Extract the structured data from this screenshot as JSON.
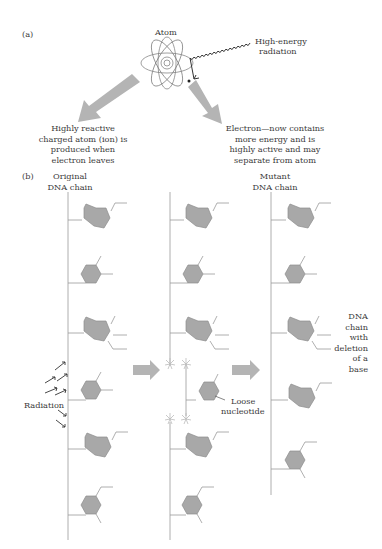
{
  "panel_a": {
    "label": "(a)",
    "atom_label": "Atom",
    "radiation_label_line1": "High-energy",
    "radiation_label_line2": "radiation",
    "left_result": [
      "Highly reactive",
      "charged atom (ion) is",
      "produced when",
      "electron leaves"
    ],
    "right_result": [
      "Electron—now contains",
      "more energy and is",
      "highly active and may",
      "separate from atom"
    ]
  },
  "panel_b": {
    "label": "(b)",
    "original_chain_label": [
      "Original",
      "DNA chain"
    ],
    "mutant_chain_label": [
      "Mutant",
      "DNA chain"
    ],
    "radiation_label": "Radiation",
    "loose_nucleotide_label": [
      "Loose",
      "nucleotide"
    ],
    "deletion_label": [
      "DNA",
      "chain",
      "with",
      "deletion",
      "of a",
      "base"
    ]
  },
  "colors": {
    "base_fill": "#a8a8a8",
    "base_stroke": "#8c8c8c",
    "arrow_fill": "#b4b4b4",
    "line": "#9a9a9a",
    "text": "#3a3a3a"
  }
}
